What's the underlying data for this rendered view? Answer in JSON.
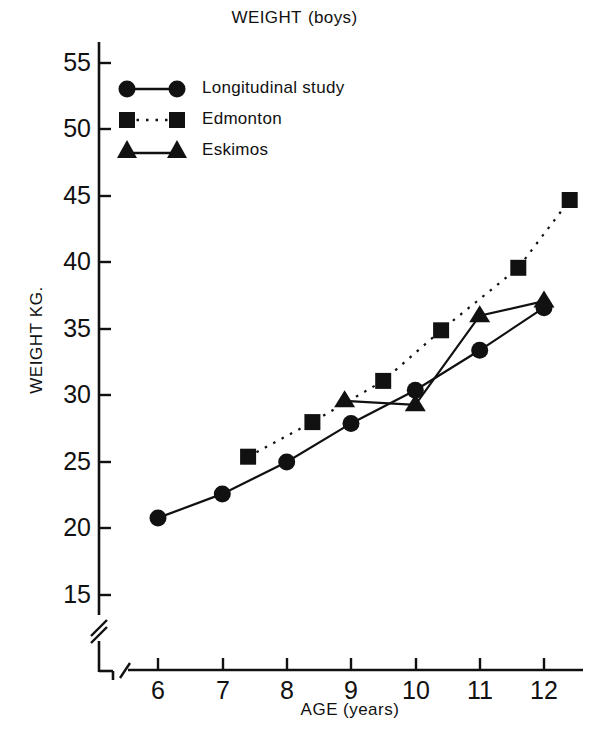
{
  "chart_data": {
    "type": "line",
    "title_main": "WEIGHT",
    "title_sub": "(boys)",
    "xlabel": "AGE (years)",
    "xlabel_main": "AGE",
    "xlabel_sub": "(years)",
    "ylabel": "WEIGHT KG.",
    "xlim": [
      5.4,
      12.8
    ],
    "ylim": [
      13.5,
      56.5
    ],
    "xticks": [
      6,
      7,
      8,
      9,
      10,
      11,
      12
    ],
    "xtick_labels": [
      "6",
      "7",
      "8",
      "9",
      "10",
      "11",
      "12"
    ],
    "yticks": [
      15,
      20,
      25,
      30,
      35,
      40,
      45,
      50,
      55
    ],
    "ytick_labels": [
      "15",
      "20",
      "25",
      "30",
      "35",
      "40",
      "45",
      "50",
      "55"
    ],
    "grid": false,
    "axis_break_x": true,
    "axis_break_y": true,
    "legend_position": "upper left inside",
    "series": [
      {
        "name": "Longitudinal study",
        "marker": "circle",
        "linestyle": "solid",
        "color": "#111111",
        "points": [
          {
            "x": 6.0,
            "y": 20.8
          },
          {
            "x": 7.0,
            "y": 22.6
          },
          {
            "x": 8.0,
            "y": 25.0
          },
          {
            "x": 9.0,
            "y": 27.9
          },
          {
            "x": 10.0,
            "y": 30.4
          },
          {
            "x": 11.0,
            "y": 33.4
          },
          {
            "x": 12.0,
            "y": 36.6
          }
        ]
      },
      {
        "name": "Edmonton",
        "marker": "square",
        "linestyle": "dotted",
        "color": "#111111",
        "points": [
          {
            "x": 7.4,
            "y": 25.4
          },
          {
            "x": 8.4,
            "y": 28.0
          },
          {
            "x": 9.5,
            "y": 31.1
          },
          {
            "x": 10.4,
            "y": 34.9
          },
          {
            "x": 11.6,
            "y": 39.6
          },
          {
            "x": 12.4,
            "y": 44.7
          }
        ]
      },
      {
        "name": "Eskimos",
        "marker": "triangle",
        "linestyle": "solid",
        "color": "#111111",
        "points": [
          {
            "x": 8.9,
            "y": 29.6
          },
          {
            "x": 10.0,
            "y": 29.3
          },
          {
            "x": 11.0,
            "y": 36.0
          },
          {
            "x": 12.0,
            "y": 37.1
          }
        ]
      }
    ]
  },
  "legend": {
    "items": [
      {
        "label": "Longitudinal study",
        "marker": "circle",
        "linestyle": "solid"
      },
      {
        "label": "Edmonton",
        "marker": "square",
        "linestyle": "dotted"
      },
      {
        "label": "Eskimos",
        "marker": "triangle",
        "linestyle": "solid"
      }
    ]
  }
}
